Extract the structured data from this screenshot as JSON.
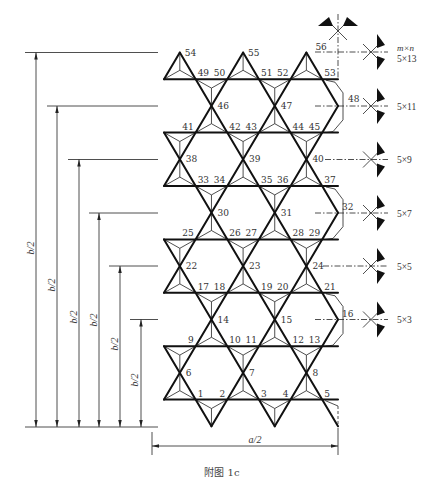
{
  "figure": {
    "caption": "附图 1c"
  },
  "dimensions": {
    "horizontal_label": "a/2",
    "vertical_labels": [
      "b/2",
      "b/2",
      "b/2",
      "b/2",
      "b/2",
      "b/2"
    ]
  },
  "nodes": [
    "1",
    "2",
    "3",
    "4",
    "5",
    "6",
    "7",
    "8",
    "9",
    "10",
    "11",
    "12",
    "13",
    "14",
    "15",
    "16",
    "17",
    "18",
    "19",
    "20",
    "21",
    "22",
    "23",
    "24",
    "25",
    "26",
    "27",
    "28",
    "29",
    "30",
    "31",
    "32",
    "33",
    "34",
    "35",
    "36",
    "37",
    "38",
    "39",
    "40",
    "41",
    "42",
    "43",
    "44",
    "45",
    "46",
    "47",
    "48",
    "49",
    "50",
    "51",
    "52",
    "53",
    "54",
    "55",
    "56"
  ],
  "supports": {
    "header": "m×n",
    "labels": [
      "5×13",
      "5×11",
      "5×9",
      "5×7",
      "5×5",
      "5×3"
    ],
    "symbol": "support-icon"
  }
}
